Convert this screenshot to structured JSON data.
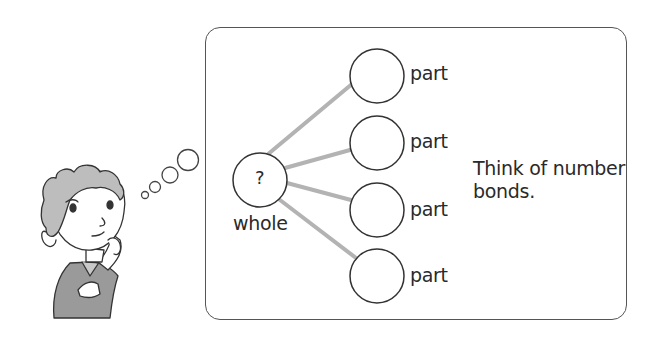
{
  "diagram": {
    "type": "number-bond",
    "whole": {
      "symbol": "?",
      "label": "whole"
    },
    "parts": [
      {
        "label": "part",
        "value": ""
      },
      {
        "label": "part",
        "value": ""
      },
      {
        "label": "part",
        "value": ""
      },
      {
        "label": "part",
        "value": ""
      }
    ],
    "hint": "Think of number bonds.",
    "hint_lines": [
      "Think of number",
      "bonds."
    ],
    "colors": {
      "connector": "#b3b3b3",
      "outline": "#333333",
      "frame": "#555555",
      "shirt": "#9a9a9a",
      "hair": "#bdbdbd"
    }
  },
  "illustration": {
    "subject": "thinking-boy",
    "thought_bubbles": 4
  }
}
